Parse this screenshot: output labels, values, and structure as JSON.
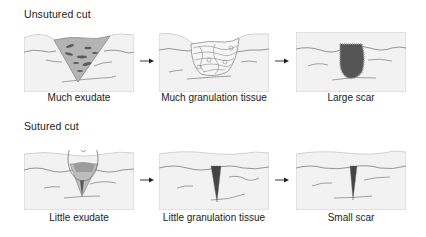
{
  "rows": [
    {
      "title": "Unsutured cut",
      "stages": [
        {
          "caption": "Much exudate"
        },
        {
          "caption": "Much granulation tissue"
        },
        {
          "caption": "Large scar"
        }
      ]
    },
    {
      "title": "Sutured cut",
      "stages": [
        {
          "caption": "Little exudate"
        },
        {
          "caption": "Little granulation tissue"
        },
        {
          "caption": "Small scar"
        }
      ]
    }
  ],
  "colors": {
    "skin_fill": "#f2f2f2",
    "panel_border": "#c8c8c8",
    "line": "#8a8a8a",
    "exudate_fill": "#b4b4b4",
    "scar_dark": "#555555",
    "arrow": "#222222"
  }
}
